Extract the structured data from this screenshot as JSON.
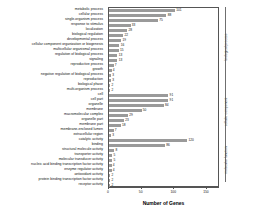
{
  "chart_data": {
    "type": "bar",
    "orientation": "horizontal",
    "title": "",
    "xlabel": "Number of Genes",
    "ylabel": "",
    "xlim": [
      0,
      170
    ],
    "grid": false,
    "legend": false,
    "bar_color": "#9a9a9a",
    "xticks": [
      0,
      50,
      100,
      150
    ],
    "xtick_labels": [
      "0",
      "50",
      "100",
      "150"
    ],
    "groups": [
      {
        "name": "biological process",
        "count": 16
      },
      {
        "name": "cellular component",
        "count": 10
      },
      {
        "name": "molecular function",
        "count": 9
      }
    ],
    "categories": [
      "metabolic process",
      "cellular process",
      "single-organism process",
      "response to stimulus",
      "localization",
      "biological regulation",
      "developmental process",
      "cellular component organization or biogenesis",
      "multicellular organismal process",
      "regulation of biological process",
      "signaling",
      "reproductive process",
      "growth",
      "negative regulation of biological process",
      "reproduction",
      "biological phase",
      "multi-organism process",
      "cell",
      "cell part",
      "organelle",
      "membrane",
      "macromolecular complex",
      "organelle part",
      "membrane part",
      "membrane-enclosed lumen",
      "extracellular region",
      "catalytic activity",
      "binding",
      "structural molecule activity",
      "transporter activity",
      "molecular transducer activity",
      "nucleic acid binding transcription factor activity",
      "enzyme regulator activity",
      "antioxidant activity",
      "protein binding transcription factor activity",
      "receptor activity"
    ],
    "values": [
      101,
      88,
      75,
      33,
      28,
      22,
      19,
      16,
      15,
      13,
      13,
      7,
      4,
      3,
      3,
      2,
      2,
      91,
      91,
      84,
      50,
      29,
      23,
      18,
      7,
      3,
      120,
      86,
      8,
      5,
      5,
      4,
      4,
      2,
      2,
      2
    ],
    "value_labels": [
      "101",
      "88",
      "75",
      "33",
      "28",
      "22",
      "19",
      "16",
      "15",
      "13",
      "13",
      "7",
      "4",
      "3",
      "3",
      "2",
      "2",
      "91",
      "91",
      "84",
      "50",
      "29",
      "23",
      "18",
      "7",
      "3",
      "120",
      "86",
      "8",
      "5",
      "5",
      "4",
      "4",
      "2",
      "2",
      "2"
    ]
  }
}
